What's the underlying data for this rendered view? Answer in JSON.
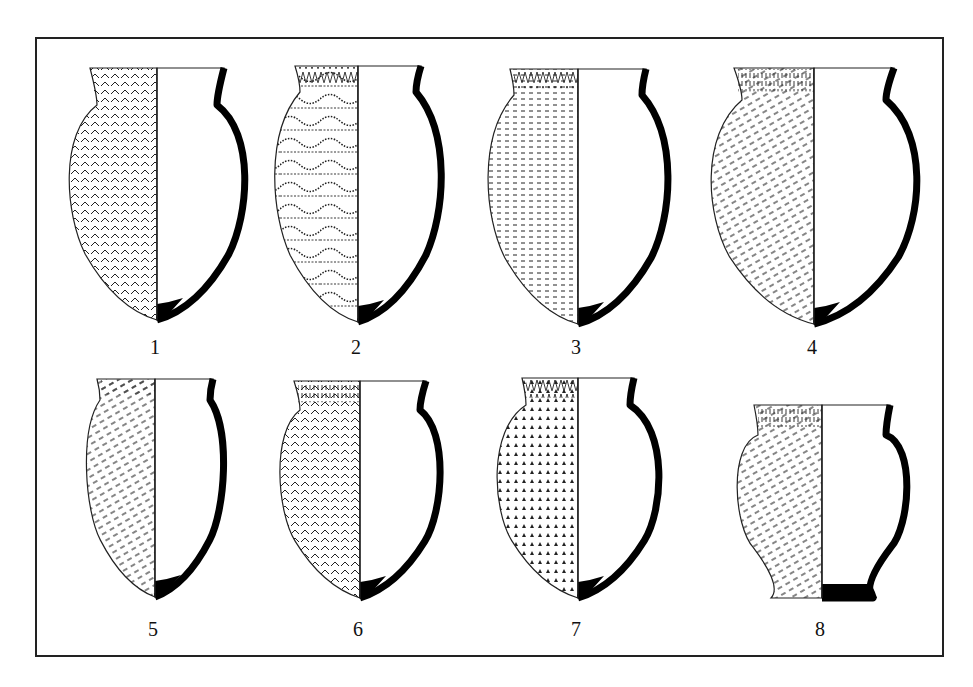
{
  "figure": {
    "type": "archaeological pottery plate",
    "frame": {
      "x": 36,
      "y": 38,
      "width": 907,
      "height": 618
    }
  },
  "vessels": [
    {
      "id": 1,
      "label": "1",
      "decoration": "herringbone incisions with dotted band below rim",
      "base": "pointed",
      "cx": 157,
      "rimY": 68,
      "baseY": 320,
      "rimHalf": 67,
      "bellyHalf": 92,
      "neckY": 105,
      "neckHalf": 60,
      "labelY": 348
    },
    {
      "id": 2,
      "label": "2",
      "decoration": "horizontal dotted bands and wavy dotted lines",
      "base": "pointed",
      "cx": 358,
      "rimY": 66,
      "baseY": 322,
      "rimHalf": 63,
      "bellyHalf": 87,
      "neckY": 92,
      "neckHalf": 58,
      "labelY": 348
    },
    {
      "id": 3,
      "label": "3",
      "decoration": "zigzag rim band, vertical columns of short dashes",
      "base": "pointed",
      "cx": 578,
      "rimY": 69,
      "baseY": 324,
      "rimHalf": 68,
      "bellyHalf": 94,
      "neckY": 95,
      "neckHalf": 64,
      "labelY": 348
    },
    {
      "id": 4,
      "label": "4",
      "decoration": "vertical stroke rim band, oblique dash bands",
      "base": "pointed",
      "cx": 814,
      "rimY": 68,
      "baseY": 324,
      "rimHalf": 80,
      "bellyHalf": 108,
      "neckY": 100,
      "neckHalf": 72,
      "labelY": 348
    },
    {
      "id": 5,
      "label": "5",
      "decoration": "rows of oblique dashes",
      "base": "pointed",
      "cx": 155,
      "rimY": 379,
      "baseY": 597,
      "rimHalf": 58,
      "bellyHalf": 70,
      "neckY": 400,
      "neckHalf": 55,
      "labelY": 630
    },
    {
      "id": 6,
      "label": "6",
      "decoration": "rim band, herringbone bands",
      "base": "flat-pointed",
      "cx": 360,
      "rimY": 381,
      "baseY": 598,
      "rimHalf": 66,
      "bellyHalf": 83,
      "neckY": 410,
      "neckHalf": 60,
      "labelY": 630
    },
    {
      "id": 7,
      "label": "7",
      "decoration": "rim band, rows of triangular stabs, herringbone bands",
      "base": "pointed",
      "cx": 578,
      "rimY": 378,
      "baseY": 598,
      "rimHalf": 56,
      "bellyHalf": 85,
      "neckY": 405,
      "neckHalf": 52,
      "labelY": 630
    },
    {
      "id": 8,
      "label": "8",
      "decoration": "rim band of vertical strokes, oblique dash bands",
      "base": "flat",
      "cx": 822,
      "rimY": 405,
      "baseY": 598,
      "rimHalf": 68,
      "bellyHalf": 88,
      "neckY": 435,
      "neckHalf": 64,
      "labelY": 630
    }
  ],
  "colors": {
    "line": "#111111",
    "section_fill": "#000000",
    "background": "#ffffff"
  }
}
